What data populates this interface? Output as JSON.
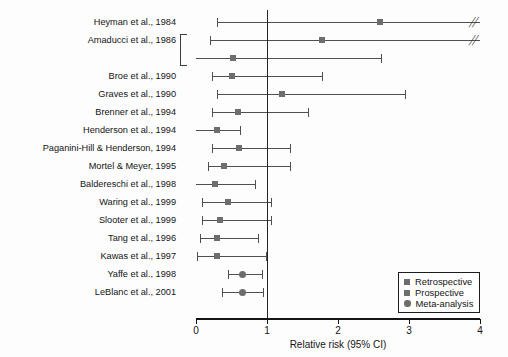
{
  "chart_data": {
    "type": "scatter",
    "title": "",
    "xlabel": "Relative risk (95% CI)",
    "ylabel": "",
    "xlim": [
      0,
      4
    ],
    "xticks": [
      0,
      1,
      2,
      3,
      4
    ],
    "xticklabels": [
      "0",
      "1",
      "2",
      "3",
      "4"
    ],
    "reference_line": 1.0,
    "grid": false,
    "legend_position": "bottom-right",
    "legend": [
      {
        "label": "Retrospective",
        "marker": "square"
      },
      {
        "label": "Prospective",
        "marker": "square"
      },
      {
        "label": "Meta-analysis",
        "marker": "circle"
      }
    ],
    "bracket_groups": [
      {
        "rows": [
          1,
          2
        ],
        "label": "Amaducci et al., 1986"
      }
    ],
    "rows": [
      {
        "study": "Heyman et al., 1984",
        "rr": 2.59,
        "lo": 0.29,
        "hi": 4.0,
        "hi_truncated": true,
        "marker": "square",
        "show_label": true
      },
      {
        "study": "Amaducci et al., 1986",
        "rr": 1.78,
        "lo": 0.2,
        "hi": 4.0,
        "hi_truncated": true,
        "marker": "square",
        "show_label": true
      },
      {
        "study": "",
        "rr": 0.52,
        "lo": 0.0,
        "hi": 2.61,
        "hi_truncated": false,
        "marker": "square",
        "show_label": false
      },
      {
        "study": "Broe et al., 1990",
        "rr": 0.5,
        "lo": 0.22,
        "hi": 1.78,
        "hi_truncated": false,
        "marker": "square",
        "show_label": true
      },
      {
        "study": "Graves et al., 1990",
        "rr": 1.21,
        "lo": 0.29,
        "hi": 2.94,
        "hi_truncated": false,
        "marker": "square",
        "show_label": true
      },
      {
        "study": "Brenner et al., 1994",
        "rr": 0.59,
        "lo": 0.22,
        "hi": 1.58,
        "hi_truncated": false,
        "marker": "square",
        "show_label": true
      },
      {
        "study": "Henderson et al., 1994",
        "rr": 0.3,
        "lo": 0.0,
        "hi": 0.62,
        "hi_truncated": false,
        "marker": "square",
        "show_label": true
      },
      {
        "study": "Paganini-Hill & Henderson, 1994",
        "rr": 0.61,
        "lo": 0.22,
        "hi": 1.33,
        "hi_truncated": false,
        "marker": "square",
        "show_label": true
      },
      {
        "study": "Mortel & Meyer, 1995",
        "rr": 0.39,
        "lo": 0.17,
        "hi": 1.33,
        "hi_truncated": false,
        "marker": "square",
        "show_label": true
      },
      {
        "study": "Baldereschi et al., 1998",
        "rr": 0.27,
        "lo": 0.0,
        "hi": 0.83,
        "hi_truncated": false,
        "marker": "square",
        "show_label": true
      },
      {
        "study": "Waring et al., 1999",
        "rr": 0.45,
        "lo": 0.08,
        "hi": 1.05,
        "hi_truncated": false,
        "marker": "square",
        "show_label": true
      },
      {
        "study": "Slooter et al., 1999",
        "rr": 0.34,
        "lo": 0.08,
        "hi": 1.05,
        "hi_truncated": false,
        "marker": "square",
        "show_label": true
      },
      {
        "study": "Tang et al., 1996",
        "rr": 0.3,
        "lo": 0.05,
        "hi": 0.87,
        "hi_truncated": false,
        "marker": "square",
        "show_label": true
      },
      {
        "study": "Kawas et al., 1997",
        "rr": 0.3,
        "lo": 0.02,
        "hi": 0.98,
        "hi_truncated": false,
        "marker": "square",
        "show_label": true
      },
      {
        "study": "Yaffe et al., 1998",
        "rr": 0.66,
        "lo": 0.45,
        "hi": 0.93,
        "hi_truncated": false,
        "marker": "circle",
        "show_label": true
      },
      {
        "study": "LeBlanc et al., 2001",
        "rr": 0.66,
        "lo": 0.37,
        "hi": 0.95,
        "hi_truncated": false,
        "marker": "circle",
        "show_label": true
      }
    ]
  },
  "colors": {
    "marker": "#6d6d6d",
    "ci": "#4f4f4f",
    "axis": "#151515",
    "reference": "#242424",
    "text": "#141414"
  }
}
